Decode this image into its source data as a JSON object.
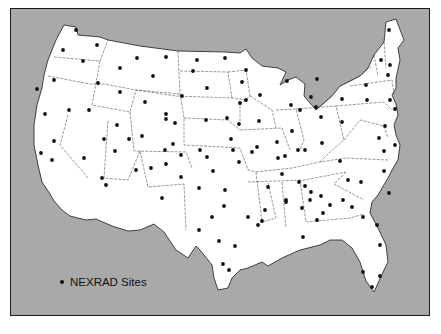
{
  "map": {
    "title": "",
    "region": "Contiguous United States",
    "colors": {
      "background": "#a9a9a9",
      "land": "#ffffff",
      "border": "#1a1a1a",
      "site": "#111111"
    }
  },
  "legend": {
    "symbol": "site-dot",
    "label": "NEXRAD Sites"
  },
  "sites": [
    [
      76,
      30
    ],
    [
      97,
      45
    ],
    [
      63,
      50
    ],
    [
      83,
      61
    ],
    [
      54,
      80
    ],
    [
      37,
      89
    ],
    [
      137,
      58
    ],
    [
      166,
      57
    ],
    [
      120,
      68
    ],
    [
      153,
      76
    ],
    [
      98,
      83
    ],
    [
      120,
      92
    ],
    [
      145,
      102
    ],
    [
      197,
      60
    ],
    [
      225,
      58
    ],
    [
      193,
      71
    ],
    [
      207,
      88
    ],
    [
      182,
      96
    ],
    [
      166,
      119
    ],
    [
      175,
      123
    ],
    [
      45,
      114
    ],
    [
      69,
      110
    ],
    [
      89,
      110
    ],
    [
      54,
      141
    ],
    [
      41,
      153
    ],
    [
      52,
      160
    ],
    [
      84,
      158
    ],
    [
      104,
      139
    ],
    [
      117,
      125
    ],
    [
      106,
      185
    ],
    [
      102,
      178
    ],
    [
      115,
      151
    ],
    [
      129,
      139
    ],
    [
      142,
      136
    ],
    [
      166,
      114
    ],
    [
      165,
      150
    ],
    [
      173,
      144
    ],
    [
      136,
      170
    ],
    [
      151,
      168
    ],
    [
      166,
      164
    ],
    [
      162,
      198
    ],
    [
      181,
      177
    ],
    [
      181,
      155
    ],
    [
      200,
      150
    ],
    [
      199,
      188
    ],
    [
      213,
      171
    ],
    [
      207,
      157
    ],
    [
      233,
      150
    ],
    [
      231,
      139
    ],
    [
      239,
      124
    ],
    [
      227,
      118
    ],
    [
      240,
      103
    ],
    [
      242,
      82
    ],
    [
      246,
      70
    ],
    [
      206,
      120
    ],
    [
      225,
      190
    ],
    [
      224,
      206
    ],
    [
      212,
      217
    ],
    [
      199,
      230
    ],
    [
      219,
      241
    ],
    [
      235,
      246
    ],
    [
      258,
      225
    ],
    [
      248,
      217
    ],
    [
      265,
      210
    ],
    [
      268,
      187
    ],
    [
      286,
      200
    ],
    [
      311,
      192
    ],
    [
      321,
      196
    ],
    [
      298,
      150
    ],
    [
      322,
      143
    ],
    [
      292,
      131
    ],
    [
      277,
      142
    ],
    [
      278,
      158
    ],
    [
      305,
      186
    ],
    [
      310,
      200
    ],
    [
      323,
      213
    ],
    [
      317,
      220
    ],
    [
      282,
      174
    ],
    [
      286,
      202
    ],
    [
      299,
      182
    ],
    [
      302,
      208
    ],
    [
      285,
      156
    ],
    [
      321,
      117
    ],
    [
      291,
      105
    ],
    [
      287,
      81
    ],
    [
      311,
      97
    ],
    [
      317,
      79
    ],
    [
      316,
      107
    ],
    [
      300,
      110
    ],
    [
      342,
      122
    ],
    [
      340,
      161
    ],
    [
      361,
      182
    ],
    [
      384,
      171
    ],
    [
      389,
      193
    ],
    [
      384,
      151
    ],
    [
      379,
      138
    ],
    [
      366,
      85
    ],
    [
      388,
      75
    ],
    [
      342,
      99
    ],
    [
      367,
      100
    ],
    [
      395,
      109
    ],
    [
      385,
      126
    ],
    [
      390,
      100
    ],
    [
      390,
      65
    ],
    [
      381,
      60
    ],
    [
      389,
      30
    ],
    [
      395,
      145
    ],
    [
      377,
      225
    ],
    [
      380,
      245
    ],
    [
      372,
      287
    ],
    [
      363,
      272
    ],
    [
      380,
      276
    ],
    [
      363,
      217
    ],
    [
      352,
      207
    ],
    [
      348,
      180
    ],
    [
      330,
      205
    ],
    [
      343,
      200
    ],
    [
      303,
      237
    ],
    [
      262,
      221
    ],
    [
      229,
      270
    ],
    [
      223,
      264
    ],
    [
      239,
      162
    ],
    [
      252,
      152
    ],
    [
      257,
      147
    ],
    [
      305,
      150
    ],
    [
      259,
      121
    ],
    [
      260,
      95
    ],
    [
      246,
      100
    ]
  ]
}
